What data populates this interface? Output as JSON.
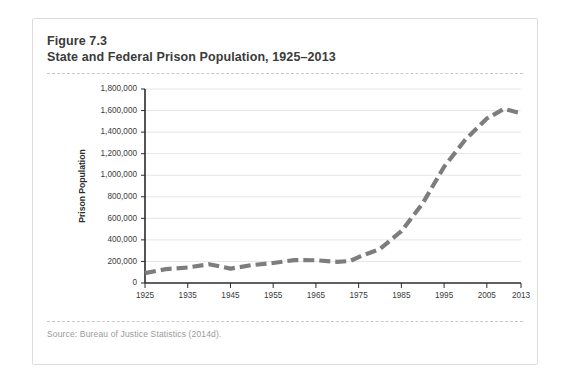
{
  "figure": {
    "number": "Figure 7.3",
    "title": "State and Federal Prison Population, 1925–2013",
    "source": "Source: Bureau of Justice Statistics (2014d)."
  },
  "style": {
    "line_color": "#7d7d7d",
    "grid_color": "#e2e2e2",
    "axis_color": "#2b2b2b",
    "card_border": "#dcdcdc",
    "heading_color": "#3b3b3b",
    "source_color": "#9a9a9a"
  },
  "chart_data": {
    "type": "line",
    "title": "State and Federal Prison Population, 1925–2013",
    "xlabel": "",
    "ylabel": "Prison Population",
    "xlim": [
      1925,
      2013
    ],
    "ylim": [
      0,
      1800000
    ],
    "grid": true,
    "legend": "none",
    "line_style": "dashed",
    "xticks": [
      1925,
      1935,
      1945,
      1955,
      1965,
      1975,
      1985,
      1995,
      2005,
      2013
    ],
    "xtick_labels": [
      "1925",
      "1935",
      "1945",
      "1955",
      "1965",
      "1975",
      "1985",
      "1995",
      "2005",
      "2013"
    ],
    "yticks": [
      0,
      200000,
      400000,
      600000,
      800000,
      1000000,
      1200000,
      1400000,
      1600000,
      1800000
    ],
    "ytick_labels": [
      "0",
      "200,000",
      "400,000",
      "600,000",
      "800,000",
      "1,000,000",
      "1,200,000",
      "1,400,000",
      "1,600,000",
      "1,800,000"
    ],
    "x": [
      1925,
      1930,
      1935,
      1940,
      1945,
      1950,
      1955,
      1960,
      1965,
      1970,
      1973,
      1975,
      1980,
      1985,
      1990,
      1995,
      2000,
      2005,
      2009,
      2013
    ],
    "values": [
      91669,
      129453,
      144180,
      173706,
      133649,
      166123,
      185780,
      212953,
      210895,
      196441,
      204211,
      240593,
      315974,
      480568,
      739980,
      1078542,
      1331278,
      1525924,
      1615487,
      1574741
    ],
    "series": [
      {
        "name": "State and Federal Prison Population",
        "values": [
          91669,
          129453,
          144180,
          173706,
          133649,
          166123,
          185780,
          212953,
          210895,
          196441,
          204211,
          240593,
          315974,
          480568,
          739980,
          1078542,
          1331278,
          1525924,
          1615487,
          1574741
        ]
      }
    ]
  }
}
